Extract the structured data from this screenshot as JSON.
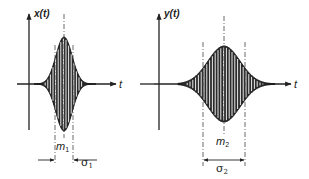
{
  "figure": {
    "left_panel": {
      "y_axis_label": "x(t)",
      "x_axis_label": "t",
      "mean_label": "m",
      "mean_subscript": "1",
      "sigma_label": "σ",
      "sigma_subscript": "1",
      "description": "Narrow, tall Gaussian-enveloped oscillating pulse"
    },
    "right_panel": {
      "y_axis_label": "y(t)",
      "x_axis_label": "t",
      "mean_label": "m",
      "mean_subscript": "2",
      "sigma_label": "σ",
      "sigma_subscript": "2",
      "description": "Wider, shorter Gaussian-enveloped oscillating pulse"
    }
  },
  "icons": {
    "axis_arrow": "arrowhead",
    "dimension_arrow": "arrowhead"
  },
  "colors": {
    "ink": "#222222",
    "background": "#ffffff"
  }
}
